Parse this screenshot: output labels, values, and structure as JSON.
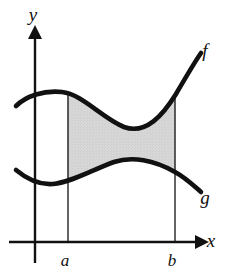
{
  "figure": {
    "kind": "area-between-curves",
    "background_color": "#ffffff",
    "ink_color": "#111111",
    "shade_color": "#d5d5d5",
    "shade_edge_color": "#c8c8c8"
  },
  "axes": {
    "x_axis": {
      "name": "x-axis",
      "label": "x",
      "label_x": 211,
      "label_y": 247,
      "y": 242,
      "x_start": 9,
      "x_end": 196,
      "arrow_tip_x": 204,
      "stroke_width": 2.4
    },
    "y_axis": {
      "name": "y-axis",
      "label": "y",
      "label_x": 33,
      "label_y": 21,
      "x": 35,
      "y_start": 263,
      "y_end": 38,
      "arrow_tip_y": 27,
      "stroke_width": 2.4
    }
  },
  "ticks": [
    {
      "name": "tick-a",
      "label": "a",
      "x": 68,
      "label_x": 63,
      "label_y": 266
    },
    {
      "name": "tick-b",
      "label": "b",
      "x": 175,
      "label_x": 170,
      "label_y": 266
    }
  ],
  "boundary_lines": [
    {
      "name": "vertical-line-at-a",
      "x": 68,
      "y_bottom": 242,
      "y_top": 92,
      "stroke_width": 1.3
    },
    {
      "name": "vertical-line-at-b",
      "x": 175,
      "y_bottom": 242,
      "y_top": 95,
      "stroke_width": 1.3
    }
  ],
  "curves": [
    {
      "name": "curve-f",
      "label": "f",
      "label_x": 205,
      "label_y": 57,
      "role": "upper-boundary",
      "stroke_width": 4.6,
      "path": "M 16 106 C 26 96, 44 90, 62 92 C 82 94, 102 118, 124 127 C 146 135, 163 115, 176 94 C 186 77, 194 63, 201 53",
      "path_in_interval": "M 68 92.4 C 84 95, 102 118, 124 127 C 146 135, 163 115, 175 95"
    },
    {
      "name": "curve-g",
      "label": "g",
      "label_x": 205,
      "label_y": 204,
      "role": "lower-boundary",
      "stroke_width": 4.6,
      "path": "M 16 170 C 28 180, 40 185, 53 184 C 72 182, 92 170, 114 162 C 132 156, 154 160, 175 172 C 186 178, 194 186, 201 192",
      "path_in_interval": "M 68 180.6 C 86 176, 96 168, 114 162 C 132 156, 154 160, 175 172"
    }
  ],
  "shaded_region": {
    "name": "shaded-area-between-curves",
    "from_tick": "a",
    "to_tick": "b",
    "path": "M 68 92.4 C 84 95, 102 118, 124 127 C 146 135, 163 115, 175 95 L 175 172 C 154 160, 132 156, 114 162 C 96 168, 86 176, 68 180.6 Z"
  }
}
